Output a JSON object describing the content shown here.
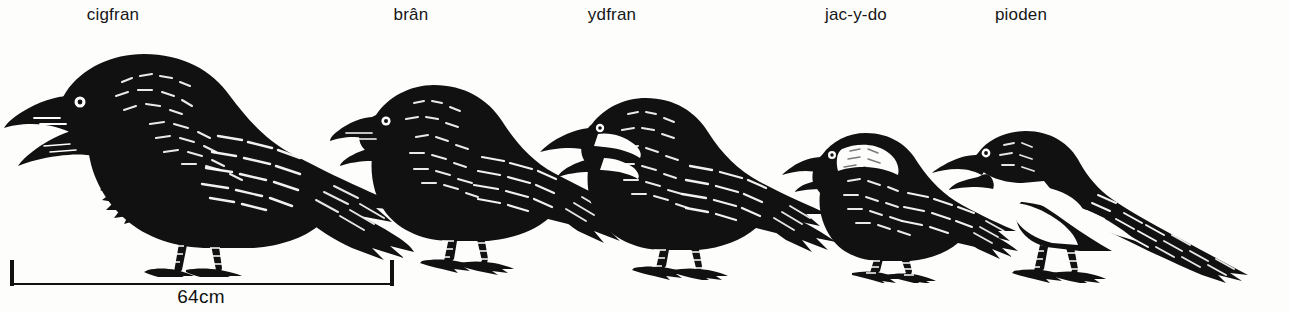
{
  "plate": {
    "title_language": "Welsh",
    "background_color": "#fdfdfc",
    "ink_color": "#111111",
    "width": 1289,
    "height": 313
  },
  "labels": [
    {
      "text": "cigfran",
      "center_x": 113,
      "name": "label-cigfran"
    },
    {
      "text": "brân",
      "center_x": 411,
      "name": "label-bran"
    },
    {
      "text": "ydfran",
      "center_x": 612,
      "name": "label-ydfran"
    },
    {
      "text": "jac-y-do",
      "center_x": 856,
      "name": "label-jac-y-do"
    },
    {
      "text": "pioden",
      "center_x": 1021,
      "name": "label-pioden"
    }
  ],
  "birds": [
    {
      "name": "raven",
      "label": "cigfran",
      "left": 4,
      "width": 410,
      "height": 235,
      "fill": "#111111"
    },
    {
      "name": "carrion-crow",
      "label": "brân",
      "left": 330,
      "width": 300,
      "height": 205,
      "fill": "#111111"
    },
    {
      "name": "rook",
      "label": "ydfran",
      "left": 540,
      "width": 300,
      "height": 190,
      "fill": "#111111"
    },
    {
      "name": "jackdaw",
      "label": "jac-y-do",
      "left": 780,
      "width": 235,
      "height": 160,
      "fill": "#111111"
    },
    {
      "name": "magpie",
      "label": "pioden",
      "left": 930,
      "width": 330,
      "height": 155,
      "fill": "#111111"
    }
  ],
  "scale_bar": {
    "caption": "64cm",
    "caption_center_x": 201,
    "start_x": 11,
    "end_x": 393,
    "tick_height": 26,
    "line_y": 22,
    "color": "#111111"
  }
}
